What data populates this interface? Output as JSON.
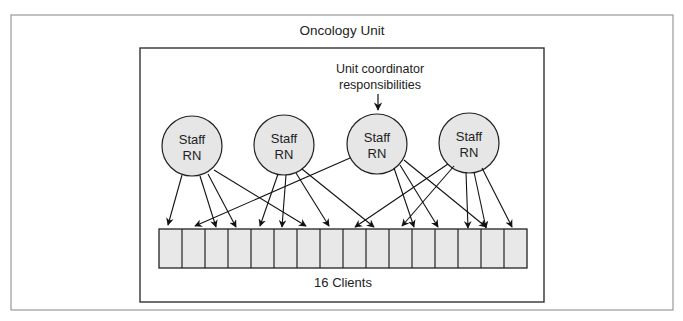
{
  "title": "Oncology Unit",
  "annotation": {
    "line1": "Unit coordinator",
    "line2": "responsibilities"
  },
  "staff": [
    {
      "line1": "Staff",
      "line2": "RN"
    },
    {
      "line1": "Staff",
      "line2": "RN"
    },
    {
      "line1": "Staff",
      "line2": "RN"
    },
    {
      "line1": "Staff",
      "line2": "RN"
    }
  ],
  "clients_label": "16 Clients",
  "client_count": 16,
  "colors": {
    "node_fill": "#e6e6e6",
    "stroke": "#222222",
    "outer_border": "#999999"
  }
}
